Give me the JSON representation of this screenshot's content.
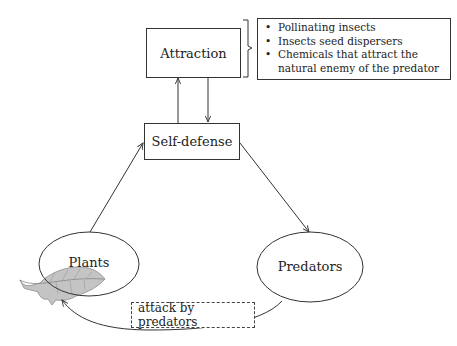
{
  "diagram": {
    "nodes": {
      "attraction": {
        "label": "Attraction",
        "shape": "rectangle"
      },
      "self_defense": {
        "label": "Self-defense",
        "shape": "rectangle"
      },
      "plants": {
        "label": "Plants",
        "shape": "ellipse"
      },
      "predators": {
        "label": "Predators",
        "shape": "ellipse"
      }
    },
    "attraction_details": {
      "items": [
        "Pollinating insects",
        "Insects seed dispersers",
        "Chemicals that attract the natural enemy of the predator"
      ]
    },
    "edges": [
      {
        "from": "Plants",
        "to": "Self-defense"
      },
      {
        "from": "Self-defense",
        "to": "Predators"
      },
      {
        "from": "Self-defense",
        "to": "Attraction"
      },
      {
        "from": "Attraction",
        "to": "Self-defense"
      },
      {
        "from": "Predators",
        "to": "Plants",
        "label": "attack by predators"
      }
    ],
    "edge_labels": {
      "attack": "attack by predators"
    },
    "colors": {
      "stroke": "#333333",
      "leaf_fill": "#bdbdbd",
      "leaf_vein": "#8a8a8a"
    }
  }
}
